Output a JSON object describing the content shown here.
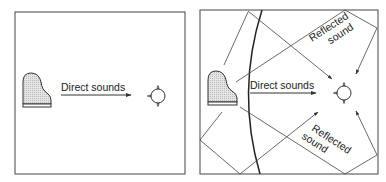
{
  "left_panel": {
    "direct_label": "Direct sounds"
  },
  "right_panel": {
    "direct_label": "Direct sounds",
    "reflected_top_line1": "Reflected",
    "reflected_top_line2": "sound",
    "reflected_bottom_line1": "Reflected",
    "reflected_bottom_line2": "sound"
  },
  "colors": {
    "stroke": "#333333",
    "piano_fill": "#d9d9d9"
  }
}
